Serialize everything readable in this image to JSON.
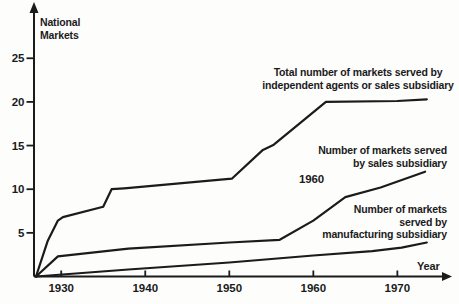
{
  "figure": {
    "background": "#fdfdfc",
    "line_color": "#1b1b1b",
    "text_color": "#1b1b1b"
  },
  "labels": {
    "y_axis_title": "National\nMarkets",
    "x_axis_title": "Year",
    "total_series_label": "Total number of markets served by\nindependent agents or sales subsidiary",
    "sales_series_label": "Number of markets served\nby sales subsidiary",
    "manufacturing_series_label": "Number of markets\nserved by\nmanufacturing subsidiary",
    "annotation_1960": "1960"
  },
  "chart_data": {
    "type": "line",
    "title": "",
    "xlabel": "Year",
    "ylabel": "National Markets",
    "xlim": [
      1927,
      1976.5
    ],
    "ylim": [
      0,
      30.3
    ],
    "x_ticks": [
      1930,
      1940,
      1950,
      1960,
      1970
    ],
    "y_ticks": [
      5,
      10,
      15,
      20,
      25
    ],
    "grid": false,
    "legend_position": "inline-annotations",
    "series": [
      {
        "name": "Total number of markets served by independent agents or sales subsidiary",
        "points": [
          [
            1927,
            0
          ],
          [
            1928.4,
            4.1
          ],
          [
            1929.6,
            6.4
          ],
          [
            1930.2,
            6.8
          ],
          [
            1935,
            8
          ],
          [
            1936,
            10
          ],
          [
            1937.5,
            10.1
          ],
          [
            1950.3,
            11.2
          ],
          [
            1954,
            14.5
          ],
          [
            1955.3,
            15.1
          ],
          [
            1961.5,
            20
          ],
          [
            1970,
            20.1
          ],
          [
            1973.5,
            20.3
          ]
        ]
      },
      {
        "name": "Number of markets served by sales subsidiary",
        "annotation": "1960",
        "points": [
          [
            1927,
            0
          ],
          [
            1929.6,
            2.3
          ],
          [
            1938,
            3.2
          ],
          [
            1950,
            3.9
          ],
          [
            1956,
            4.2
          ],
          [
            1960,
            6.4
          ],
          [
            1963.8,
            9.1
          ],
          [
            1968,
            10.2
          ],
          [
            1973.3,
            12
          ]
        ]
      },
      {
        "name": "Number of markets served by manufacturing subsidiary",
        "points": [
          [
            1927,
            0
          ],
          [
            1938,
            0.8
          ],
          [
            1950,
            1.6
          ],
          [
            1960,
            2.4
          ],
          [
            1967,
            2.9
          ],
          [
            1970.5,
            3.3
          ],
          [
            1973.5,
            3.9
          ]
        ]
      }
    ]
  }
}
